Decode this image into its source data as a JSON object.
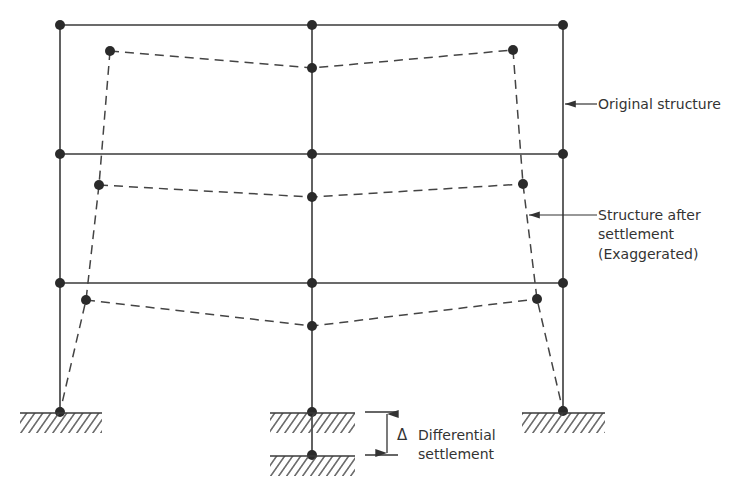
{
  "diagram": {
    "type": "structural frame settlement",
    "colors": {
      "line": "#3a3a3a",
      "node": "#2a2a2a",
      "text": "#333333",
      "background": "#ffffff"
    },
    "labels": {
      "original": "Original structure",
      "after_line1": "Structure after",
      "after_line2": "settlement",
      "after_line3": "(Exaggerated)",
      "delta_symbol": "Δ",
      "diff_line1": "Differential",
      "diff_line2": "settlement"
    },
    "original_structure": {
      "columns_x": [
        60,
        312,
        563
      ],
      "floors_y": [
        25,
        154,
        283
      ],
      "base_y": 412,
      "nodes": [
        [
          60,
          25
        ],
        [
          312,
          25
        ],
        [
          563,
          25
        ],
        [
          60,
          154
        ],
        [
          312,
          154
        ],
        [
          563,
          154
        ],
        [
          60,
          283
        ],
        [
          312,
          283
        ],
        [
          563,
          283
        ],
        [
          60,
          412
        ],
        [
          312,
          412
        ],
        [
          563,
          411
        ]
      ]
    },
    "settled_structure": {
      "style": "dashed",
      "nodes": [
        [
          110,
          51
        ],
        [
          312,
          68
        ],
        [
          513,
          50
        ],
        [
          99,
          185
        ],
        [
          312,
          197
        ],
        [
          523,
          184
        ],
        [
          86,
          300
        ],
        [
          312,
          326
        ],
        [
          537,
          299
        ],
        [
          60,
          412
        ],
        [
          312,
          455
        ],
        [
          563,
          411
        ]
      ]
    },
    "supports": [
      {
        "name": "left-ground",
        "x1": 20,
        "x2": 102,
        "y": 413
      },
      {
        "name": "middle-ground-original",
        "x1": 270,
        "x2": 355,
        "y": 413
      },
      {
        "name": "middle-ground-settled",
        "x1": 270,
        "x2": 355,
        "y": 456
      },
      {
        "name": "right-ground",
        "x1": 522,
        "x2": 605,
        "y": 413
      }
    ]
  }
}
